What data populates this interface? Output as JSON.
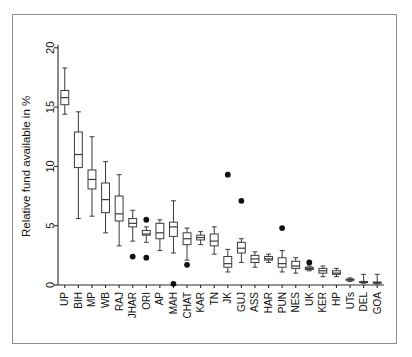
{
  "figure": {
    "title": "",
    "background_color": "#ffffff",
    "frame_color": "#8d8d8d",
    "ink_color": "#3a3a3a",
    "outlier_color": "#111111"
  },
  "chart_data": {
    "type": "box",
    "title": "",
    "subtitle": "",
    "xlabel": "",
    "ylabel": "Relative fund available in %",
    "ylim": [
      0,
      21.5
    ],
    "yticks": [
      0,
      5,
      10,
      15,
      20
    ],
    "ytick_labels": [
      "0",
      "5",
      "10",
      "15",
      "20"
    ],
    "grid": false,
    "legend": null,
    "orientation": "vertical",
    "categories": [
      "UP",
      "BIH",
      "MP",
      "WB",
      "RAJ",
      "JHAR",
      "ORI",
      "AP",
      "MAH",
      "CHAT",
      "KAR",
      "TN",
      "JK",
      "GUJ",
      "ASS",
      "HAR",
      "PUN",
      "NES",
      "UK",
      "KER",
      "HP",
      "UTs",
      "DEL",
      "GOA"
    ],
    "boxes": [
      {
        "category": "UP",
        "whisker_low": 14.4,
        "q1": 15.2,
        "median": 15.8,
        "q3": 16.4,
        "whisker_high": 18.3,
        "outliers": []
      },
      {
        "category": "BIH",
        "whisker_low": 5.6,
        "q1": 9.9,
        "median": 11.0,
        "q3": 12.9,
        "whisker_high": 14.6,
        "outliers": []
      },
      {
        "category": "MP",
        "whisker_low": 5.8,
        "q1": 8.1,
        "median": 8.9,
        "q3": 9.7,
        "whisker_high": 12.5,
        "outliers": []
      },
      {
        "category": "WB",
        "whisker_low": 4.4,
        "q1": 6.1,
        "median": 7.2,
        "q3": 8.6,
        "whisker_high": 10.4,
        "outliers": []
      },
      {
        "category": "RAJ",
        "whisker_low": 3.3,
        "q1": 5.4,
        "median": 6.0,
        "q3": 7.5,
        "whisker_high": 9.3,
        "outliers": []
      },
      {
        "category": "JHAR",
        "whisker_low": 3.7,
        "q1": 4.9,
        "median": 5.2,
        "q3": 5.6,
        "whisker_high": 6.3,
        "outliers": [
          2.4
        ]
      },
      {
        "category": "ORI",
        "whisker_low": 3.6,
        "q1": 4.2,
        "median": 4.3,
        "q3": 4.6,
        "whisker_high": 4.9,
        "outliers": [
          5.5,
          2.3
        ]
      },
      {
        "category": "AP",
        "whisker_low": 2.9,
        "q1": 3.9,
        "median": 4.4,
        "q3": 5.2,
        "whisker_high": 5.5,
        "outliers": []
      },
      {
        "category": "MAH",
        "whisker_low": 2.7,
        "q1": 4.1,
        "median": 4.9,
        "q3": 5.3,
        "whisker_high": 7.1,
        "outliers": [
          0.1
        ]
      },
      {
        "category": "CHAT",
        "whisker_low": 2.1,
        "q1": 3.4,
        "median": 3.9,
        "q3": 4.4,
        "whisker_high": 4.8,
        "outliers": [
          1.7
        ]
      },
      {
        "category": "KAR",
        "whisker_low": 3.4,
        "q1": 3.8,
        "median": 4.0,
        "q3": 4.2,
        "whisker_high": 4.5,
        "outliers": []
      },
      {
        "category": "TN",
        "whisker_low": 2.6,
        "q1": 3.3,
        "median": 3.7,
        "q3": 4.3,
        "whisker_high": 4.9,
        "outliers": []
      },
      {
        "category": "JK",
        "whisker_low": 1.1,
        "q1": 1.5,
        "median": 1.8,
        "q3": 2.4,
        "whisker_high": 3.0,
        "outliers": [
          9.3
        ]
      },
      {
        "category": "GUJ",
        "whisker_low": 1.9,
        "q1": 2.7,
        "median": 3.1,
        "q3": 3.6,
        "whisker_high": 3.9,
        "outliers": [
          7.1
        ]
      },
      {
        "category": "ASS",
        "whisker_low": 1.5,
        "q1": 1.9,
        "median": 2.2,
        "q3": 2.5,
        "whisker_high": 2.8,
        "outliers": []
      },
      {
        "category": "HAR",
        "whisker_low": 1.9,
        "q1": 2.1,
        "median": 2.2,
        "q3": 2.4,
        "whisker_high": 2.6,
        "outliers": []
      },
      {
        "category": "PUN",
        "whisker_low": 1.1,
        "q1": 1.5,
        "median": 1.8,
        "q3": 2.3,
        "whisker_high": 2.9,
        "outliers": [
          4.8
        ]
      },
      {
        "category": "NES",
        "whisker_low": 1.0,
        "q1": 1.4,
        "median": 1.6,
        "q3": 2.0,
        "whisker_high": 2.3,
        "outliers": []
      },
      {
        "category": "UK",
        "whisker_low": 1.2,
        "q1": 1.3,
        "median": 1.4,
        "q3": 1.5,
        "whisker_high": 1.6,
        "outliers": [
          1.9
        ]
      },
      {
        "category": "KER",
        "whisker_low": 0.7,
        "q1": 1.0,
        "median": 1.2,
        "q3": 1.4,
        "whisker_high": 1.6,
        "outliers": []
      },
      {
        "category": "HP",
        "whisker_low": 0.7,
        "q1": 0.9,
        "median": 1.0,
        "q3": 1.2,
        "whisker_high": 1.4,
        "outliers": []
      },
      {
        "category": "UTs",
        "whisker_low": 0.3,
        "q1": 0.4,
        "median": 0.45,
        "q3": 0.5,
        "whisker_high": 0.6,
        "outliers": []
      },
      {
        "category": "DEL",
        "whisker_low": 0.15,
        "q1": 0.2,
        "median": 0.25,
        "q3": 0.3,
        "whisker_high": 0.9,
        "outliers": []
      },
      {
        "category": "GOA",
        "whisker_low": 0.1,
        "q1": 0.15,
        "median": 0.2,
        "q3": 0.25,
        "whisker_high": 0.9,
        "outliers": []
      }
    ]
  },
  "axes": {
    "y_axis_title": "Relative fund available in %",
    "y_tick_labels": [
      "0",
      "5",
      "10",
      "15",
      "20"
    ],
    "x_tick_labels": [
      "UP",
      "BIH",
      "MP",
      "WB",
      "RAJ",
      "JHAR",
      "ORI",
      "AP",
      "MAH",
      "CHAT",
      "KAR",
      "TN",
      "JK",
      "GUJ",
      "ASS",
      "HAR",
      "PUN",
      "NES",
      "UK",
      "KER",
      "HP",
      "UTs",
      "DEL",
      "GOA"
    ]
  }
}
